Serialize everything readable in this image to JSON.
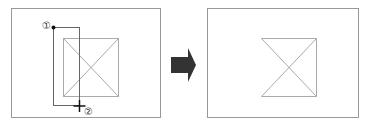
{
  "diagram": {
    "before": {
      "point_labels": [
        "①",
        "②"
      ],
      "point_1_marker": "dot",
      "point_2_marker": "crosshair"
    },
    "arrow": {
      "direction": "right",
      "color": "#333333"
    },
    "after": {
      "result": "left edge of square removed"
    },
    "colors": {
      "frame": "#999999",
      "shape": "#aaaaaa",
      "selection": "#666666",
      "arrow": "#333333"
    }
  }
}
